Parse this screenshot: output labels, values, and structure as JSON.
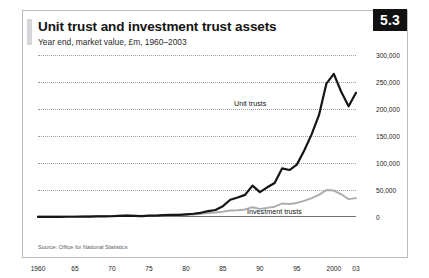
{
  "badge": {
    "label": "5.3"
  },
  "header": {
    "title": "Unit trust and investment trust assets",
    "subtitle": "Year end, market value, £m, 1960–2003"
  },
  "footer": {
    "source": "Source: Office for National Statistics"
  },
  "labels": {
    "unit_trusts": "Unit trusts",
    "investment_trusts": "Investment trusts"
  },
  "colors": {
    "unit_trusts": "#151515",
    "investment_trusts": "#a9acb0",
    "gridline": "#9a9ea2",
    "axis": "#6d7277",
    "badge_background": "#111111",
    "badge_text": "#ffffff",
    "frame_border": "#b9bcc0",
    "accent_bar": "#d4d6d9"
  },
  "chart_data": {
    "type": "line",
    "title": "Unit trust and investment trust assets",
    "subtitle": "Year end, market value, £m, 1960–2003",
    "xlabel": "",
    "ylabel": "",
    "xlim": [
      1960,
      2003
    ],
    "ylim": [
      0,
      300000
    ],
    "grid": true,
    "legend_position": "inline-annotations",
    "ytick_labels": [
      "0",
      "50,000",
      "100,000",
      "150,000",
      "200,000",
      "250,000",
      "300,000"
    ],
    "ytick_values": [
      0,
      50000,
      100000,
      150000,
      200000,
      250000,
      300000
    ],
    "xtick_labels": [
      "1960",
      "65",
      "70",
      "75",
      "80",
      "85",
      "90",
      "95",
      "2000",
      "03"
    ],
    "xtick_values": [
      1960,
      1965,
      1970,
      1975,
      1980,
      1985,
      1990,
      1995,
      2000,
      2003
    ],
    "x": [
      1960,
      1961,
      1962,
      1963,
      1964,
      1965,
      1966,
      1967,
      1968,
      1969,
      1970,
      1971,
      1972,
      1973,
      1974,
      1975,
      1976,
      1977,
      1978,
      1979,
      1980,
      1981,
      1982,
      1983,
      1984,
      1985,
      1986,
      1987,
      1988,
      1989,
      1990,
      1991,
      1992,
      1993,
      1994,
      1995,
      1996,
      1997,
      1998,
      1999,
      2000,
      2001,
      2002,
      2003
    ],
    "series": [
      {
        "name": "Unit trusts",
        "color": "#151515",
        "values": [
          200,
          250,
          300,
          400,
          450,
          500,
          550,
          700,
          1100,
          1300,
          1400,
          2000,
          2600,
          2100,
          1500,
          2500,
          2600,
          3500,
          4000,
          4000,
          4900,
          6000,
          7800,
          11000,
          13000,
          20000,
          32000,
          36000,
          41000,
          58000,
          46000,
          55000,
          63000,
          90000,
          87000,
          97000,
          123000,
          153000,
          189000,
          247000,
          265000,
          232000,
          205000,
          230000
        ]
      },
      {
        "name": "Investment trusts",
        "color": "#a9acb0",
        "values": [
          900,
          950,
          1000,
          1100,
          1150,
          1200,
          1200,
          1400,
          1800,
          1900,
          1800,
          2200,
          2700,
          2200,
          1400,
          2300,
          2300,
          2900,
          3200,
          3300,
          4100,
          4700,
          5800,
          7200,
          8400,
          10000,
          12000,
          12500,
          14000,
          18000,
          15000,
          17000,
          19000,
          25000,
          24000,
          26000,
          30000,
          35000,
          41000,
          50000,
          49000,
          42000,
          33000,
          35000
        ]
      }
    ],
    "annotations": [
      {
        "text": "Unit trusts",
        "near_year": 1995
      },
      {
        "text": "Investment trusts",
        "near_year": 1996
      }
    ]
  }
}
